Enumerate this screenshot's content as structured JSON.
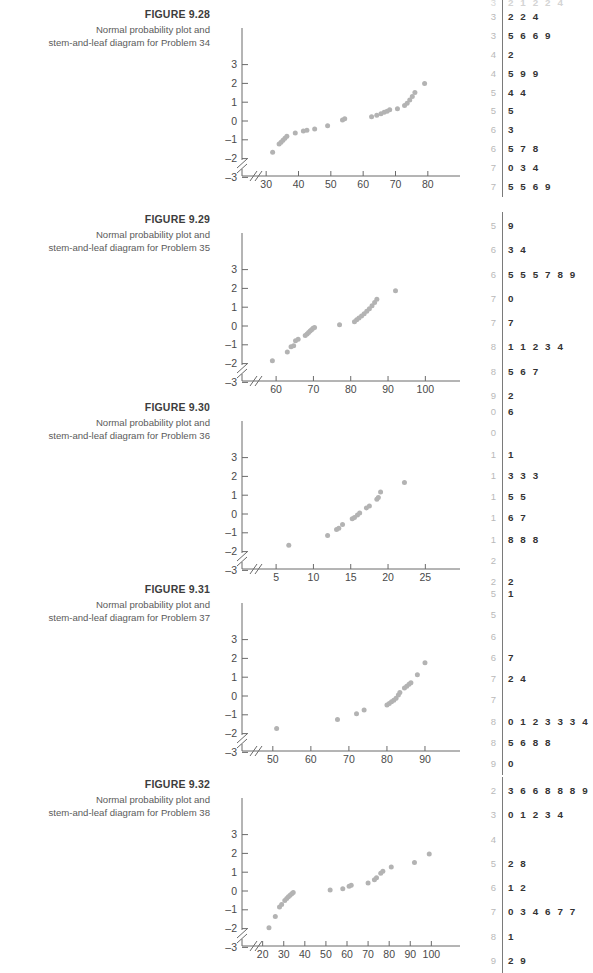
{
  "page": {
    "width": 593,
    "height": 939,
    "background": "#ffffff"
  },
  "colors": {
    "point": "#b3b3b3",
    "axis": "#6b6b6b",
    "stem": "#b9b9b9",
    "leaf": "#333333",
    "divider": "#7a7a7a",
    "title": "#3d3d3d",
    "caption": "#5b5b5b"
  },
  "partial_top_row": {
    "stem": "3",
    "leaf": "2 1 2 2 4"
  },
  "figures": [
    {
      "id": "fig-9-28",
      "top": 8,
      "title": "FIGURE 9.28",
      "desc_line1": "Normal probability plot and",
      "desc_line2": "stem-and-leaf diagram for Problem 34",
      "chart_data": {
        "type": "scatter",
        "title": "FIGURE 9.28",
        "xlabel": "",
        "ylabel": "",
        "xticks": [
          30,
          40,
          50,
          60,
          70,
          80
        ],
        "yticks": [
          3,
          2,
          1,
          0,
          -1,
          -2,
          -3
        ],
        "xlim": [
          25,
          85
        ],
        "ylim": [
          -3.6,
          3.6
        ],
        "axis_break": true,
        "grid": false,
        "legend": null,
        "points": [
          {
            "x": 32,
            "y": -1.66
          },
          {
            "x": 34,
            "y": -1.22
          },
          {
            "x": 34.6,
            "y": -1.13
          },
          {
            "x": 35.2,
            "y": -1.02
          },
          {
            "x": 35.8,
            "y": -0.92
          },
          {
            "x": 36.4,
            "y": -0.81
          },
          {
            "x": 39,
            "y": -0.64
          },
          {
            "x": 41.5,
            "y": -0.53
          },
          {
            "x": 42.6,
            "y": -0.49
          },
          {
            "x": 45,
            "y": -0.42
          },
          {
            "x": 49,
            "y": -0.25
          },
          {
            "x": 53.6,
            "y": 0.05
          },
          {
            "x": 54.3,
            "y": 0.12
          },
          {
            "x": 62.6,
            "y": 0.22
          },
          {
            "x": 64.2,
            "y": 0.3
          },
          {
            "x": 65.5,
            "y": 0.38
          },
          {
            "x": 66.5,
            "y": 0.46
          },
          {
            "x": 67.4,
            "y": 0.52
          },
          {
            "x": 68.2,
            "y": 0.6
          },
          {
            "x": 70.6,
            "y": 0.65
          },
          {
            "x": 72.8,
            "y": 0.82
          },
          {
            "x": 73.6,
            "y": 0.95
          },
          {
            "x": 74.4,
            "y": 1.12
          },
          {
            "x": 75.2,
            "y": 1.3
          },
          {
            "x": 76,
            "y": 1.52
          },
          {
            "x": 79,
            "y": 2.0
          }
        ]
      },
      "stemleaf": [
        {
          "stem": "3",
          "leaf": "2 2 4"
        },
        {
          "stem": "3",
          "leaf": "5 6 6 9"
        },
        {
          "stem": "4",
          "leaf": "2"
        },
        {
          "stem": "4",
          "leaf": "5 9 9"
        },
        {
          "stem": "5",
          "leaf": "4 4"
        },
        {
          "stem": "5",
          "leaf": "5"
        },
        {
          "stem": "6",
          "leaf": "3"
        },
        {
          "stem": "6",
          "leaf": "5 7 8"
        },
        {
          "stem": "7",
          "leaf": "0 3 4"
        },
        {
          "stem": "7",
          "leaf": "5 5 6 9"
        }
      ]
    },
    {
      "id": "fig-9-29",
      "top": 213,
      "title": "FIGURE 9.29",
      "desc_line1": "Normal probability plot and",
      "desc_line2": "stem-and-leaf diagram for Problem 35",
      "chart_data": {
        "type": "scatter",
        "title": "FIGURE 9.29",
        "xlabel": "",
        "ylabel": "",
        "xticks": [
          60,
          70,
          80,
          90,
          100
        ],
        "yticks": [
          3,
          2,
          1,
          0,
          -1,
          -2,
          -3
        ],
        "xlim": [
          53,
          105
        ],
        "ylim": [
          -3.6,
          3.6
        ],
        "axis_break": true,
        "grid": false,
        "legend": null,
        "points": [
          {
            "x": 59,
            "y": -1.85
          },
          {
            "x": 63,
            "y": -1.38
          },
          {
            "x": 64,
            "y": -1.1
          },
          {
            "x": 64.7,
            "y": -1.05
          },
          {
            "x": 65.2,
            "y": -0.78
          },
          {
            "x": 65.9,
            "y": -0.71
          },
          {
            "x": 67.8,
            "y": -0.5
          },
          {
            "x": 68.3,
            "y": -0.42
          },
          {
            "x": 68.7,
            "y": -0.34
          },
          {
            "x": 69.1,
            "y": -0.27
          },
          {
            "x": 69.5,
            "y": -0.2
          },
          {
            "x": 69.9,
            "y": -0.12
          },
          {
            "x": 70.3,
            "y": -0.08
          },
          {
            "x": 77,
            "y": 0.07
          },
          {
            "x": 81,
            "y": 0.23
          },
          {
            "x": 81.6,
            "y": 0.33
          },
          {
            "x": 82.2,
            "y": 0.43
          },
          {
            "x": 82.9,
            "y": 0.53
          },
          {
            "x": 83.6,
            "y": 0.65
          },
          {
            "x": 84.3,
            "y": 0.78
          },
          {
            "x": 85,
            "y": 0.92
          },
          {
            "x": 85.7,
            "y": 1.08
          },
          {
            "x": 86.4,
            "y": 1.25
          },
          {
            "x": 87,
            "y": 1.42
          },
          {
            "x": 92,
            "y": 1.87
          }
        ]
      },
      "stemleaf": [
        {
          "stem": "5",
          "leaf": "9"
        },
        {
          "stem": "6",
          "leaf": "3 4"
        },
        {
          "stem": "6",
          "leaf": "5 5 5 7 8 9"
        },
        {
          "stem": "7",
          "leaf": "0"
        },
        {
          "stem": "7",
          "leaf": "7"
        },
        {
          "stem": "8",
          "leaf": "1 1 2 3 4"
        },
        {
          "stem": "8",
          "leaf": "5 6 7"
        },
        {
          "stem": "9",
          "leaf": "2"
        }
      ]
    },
    {
      "id": "fig-9-30",
      "top": 401,
      "title": "FIGURE 9.30",
      "desc_line1": "Normal probability plot and",
      "desc_line2": "stem-and-leaf diagram for Problem 36",
      "chart_data": {
        "type": "scatter",
        "title": "FIGURE 9.30",
        "xlabel": "",
        "ylabel": "",
        "xticks": [
          5,
          10,
          15,
          20,
          25
        ],
        "yticks": [
          3,
          2,
          1,
          0,
          -1,
          -2,
          -3
        ],
        "xlim": [
          1.5,
          27.5
        ],
        "ylim": [
          -3.6,
          3.6
        ],
        "axis_break": true,
        "grid": false,
        "legend": null,
        "points": [
          {
            "x": 6.7,
            "y": -1.66
          },
          {
            "x": 11.9,
            "y": -1.14
          },
          {
            "x": 13.1,
            "y": -0.82
          },
          {
            "x": 13.4,
            "y": -0.76
          },
          {
            "x": 13.9,
            "y": -0.56
          },
          {
            "x": 15.2,
            "y": -0.25
          },
          {
            "x": 15.5,
            "y": -0.18
          },
          {
            "x": 15.9,
            "y": -0.05
          },
          {
            "x": 16.2,
            "y": 0.05
          },
          {
            "x": 17.1,
            "y": 0.32
          },
          {
            "x": 17.5,
            "y": 0.42
          },
          {
            "x": 18.5,
            "y": 0.78
          },
          {
            "x": 18.7,
            "y": 0.88
          },
          {
            "x": 19,
            "y": 1.17
          },
          {
            "x": 22.2,
            "y": 1.67
          }
        ]
      },
      "stemleaf": [
        {
          "stem": "0",
          "leaf": "6"
        },
        {
          "stem": "0",
          "leaf": ""
        },
        {
          "stem": "1",
          "leaf": "1"
        },
        {
          "stem": "1",
          "leaf": "3 3 3"
        },
        {
          "stem": "1",
          "leaf": "5 5"
        },
        {
          "stem": "1",
          "leaf": "6 7"
        },
        {
          "stem": "1",
          "leaf": "8 8 8"
        },
        {
          "stem": "2",
          "leaf": ""
        },
        {
          "stem": "2",
          "leaf": "2"
        }
      ]
    },
    {
      "id": "fig-9-31",
      "top": 583,
      "title": "FIGURE 9.31",
      "desc_line1": "Normal probability plot and",
      "desc_line2": "stem-and-leaf diagram for Problem 37",
      "chart_data": {
        "type": "scatter",
        "title": "FIGURE 9.31",
        "xlabel": "",
        "ylabel": "",
        "xticks": [
          50,
          60,
          70,
          80,
          90
        ],
        "yticks": [
          3,
          2,
          1,
          0,
          -1,
          -2,
          -3
        ],
        "xlim": [
          44,
          95
        ],
        "ylim": [
          -3.6,
          3.6
        ],
        "axis_break": true,
        "grid": false,
        "legend": null,
        "points": [
          {
            "x": 51,
            "y": -1.73
          },
          {
            "x": 67,
            "y": -1.25
          },
          {
            "x": 72,
            "y": -0.95
          },
          {
            "x": 74,
            "y": -0.75
          },
          {
            "x": 80,
            "y": -0.48
          },
          {
            "x": 80.6,
            "y": -0.4
          },
          {
            "x": 81.2,
            "y": -0.3
          },
          {
            "x": 81.8,
            "y": -0.22
          },
          {
            "x": 82.4,
            "y": -0.12
          },
          {
            "x": 83,
            "y": 0.05
          },
          {
            "x": 83.4,
            "y": 0.18
          },
          {
            "x": 84.6,
            "y": 0.42
          },
          {
            "x": 85.2,
            "y": 0.52
          },
          {
            "x": 85.8,
            "y": 0.62
          },
          {
            "x": 86.3,
            "y": 0.7
          },
          {
            "x": 88,
            "y": 1.13
          },
          {
            "x": 90,
            "y": 1.77
          }
        ]
      },
      "stemleaf": [
        {
          "stem": "5",
          "leaf": "1"
        },
        {
          "stem": "5",
          "leaf": ""
        },
        {
          "stem": "6",
          "leaf": ""
        },
        {
          "stem": "6",
          "leaf": "7"
        },
        {
          "stem": "7",
          "leaf": "2 4"
        },
        {
          "stem": "7",
          "leaf": ""
        },
        {
          "stem": "8",
          "leaf": "0 1 2 3 3 3 4"
        },
        {
          "stem": "8",
          "leaf": "5 6 8 8"
        },
        {
          "stem": "9",
          "leaf": "0"
        }
      ]
    },
    {
      "id": "fig-9-32",
      "top": 778,
      "title": "FIGURE 9.32",
      "desc_line1": "Normal probability plot and",
      "desc_line2": "stem-and-leaf diagram for Problem 38",
      "chart_data": {
        "type": "scatter",
        "title": "FIGURE 9.32",
        "xlabel": "",
        "ylabel": "",
        "xticks": [
          20,
          30,
          40,
          50,
          60,
          70,
          80,
          90,
          100
        ],
        "yticks": [
          3,
          2,
          1,
          0,
          -1,
          -2,
          -3
        ],
        "xlim": [
          14,
          106
        ],
        "ylim": [
          -3.6,
          3.6
        ],
        "axis_break": true,
        "grid": false,
        "legend": null,
        "points": [
          {
            "x": 23,
            "y": -1.95
          },
          {
            "x": 26,
            "y": -1.35
          },
          {
            "x": 28,
            "y": -0.85
          },
          {
            "x": 29,
            "y": -0.72
          },
          {
            "x": 30.5,
            "y": -0.5
          },
          {
            "x": 31.4,
            "y": -0.4
          },
          {
            "x": 32.2,
            "y": -0.3
          },
          {
            "x": 33,
            "y": -0.22
          },
          {
            "x": 33.8,
            "y": -0.14
          },
          {
            "x": 34.5,
            "y": -0.08
          },
          {
            "x": 52,
            "y": 0.05
          },
          {
            "x": 58,
            "y": 0.12
          },
          {
            "x": 61,
            "y": 0.25
          },
          {
            "x": 62,
            "y": 0.3
          },
          {
            "x": 70,
            "y": 0.43
          },
          {
            "x": 73,
            "y": 0.6
          },
          {
            "x": 74,
            "y": 0.7
          },
          {
            "x": 76,
            "y": 0.95
          },
          {
            "x": 77,
            "y": 1.05
          },
          {
            "x": 81,
            "y": 1.28
          },
          {
            "x": 92,
            "y": 1.52
          },
          {
            "x": 99,
            "y": 1.97
          }
        ]
      },
      "stemleaf": [
        {
          "stem": "2",
          "leaf": "3 6 6 8 8 8 9"
        },
        {
          "stem": "3",
          "leaf": "0 1 2 3 4"
        },
        {
          "stem": "4",
          "leaf": ""
        },
        {
          "stem": "5",
          "leaf": "2 8"
        },
        {
          "stem": "6",
          "leaf": "1 2"
        },
        {
          "stem": "7",
          "leaf": "0 3 4 6 7 7"
        },
        {
          "stem": "8",
          "leaf": "1"
        },
        {
          "stem": "9",
          "leaf": "2 9"
        }
      ]
    }
  ]
}
